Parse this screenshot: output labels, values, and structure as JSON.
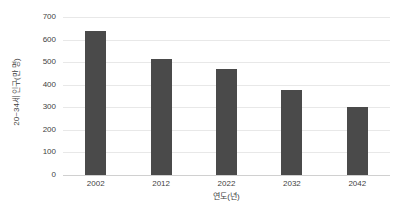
{
  "chart_data": {
    "type": "bar",
    "title": "",
    "xlabel": "연도(년)",
    "ylabel": "20~34세 인구(만 명)",
    "categories": [
      "2002",
      "2012",
      "2022",
      "2032",
      "2042"
    ],
    "values": [
      640,
      512,
      470,
      378,
      302
    ],
    "series": [
      {
        "name": "20~34세 인구(만 명)",
        "values": [
          640,
          512,
          470,
          378,
          302
        ]
      }
    ],
    "ylim": [
      0,
      700
    ],
    "y_ticks": [
      "0",
      "100",
      "200",
      "300",
      "400",
      "500",
      "600",
      "700"
    ],
    "y_tick_values": [
      0,
      100,
      200,
      300,
      400,
      500,
      600,
      700
    ],
    "x_ticks": [
      "2002",
      "2012",
      "2022",
      "2032",
      "2042"
    ],
    "grid": "horizontal",
    "legend": "none",
    "bar_color": "#4a4a4a",
    "grid_color": "#e8e8e8",
    "text_color": "#3f3f3f",
    "background_color": "#ffffff"
  }
}
